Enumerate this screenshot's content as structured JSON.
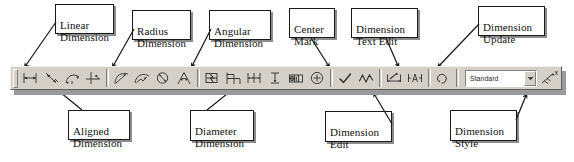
{
  "toolbar": {
    "grip_name": "toolbar-drag-grip",
    "style_combo": {
      "value": "Standard",
      "placeholder": "Standard",
      "arrow": "chevron-down-icon"
    },
    "close_label": "x",
    "buttons": [
      {
        "name": "linear-dimension",
        "label": "Linear Dimension",
        "icon": "linear-dimension-icon"
      },
      {
        "name": "aligned-dimension",
        "label": "Aligned Dimension",
        "icon": "aligned-dimension-icon"
      },
      {
        "name": "arc-length-dimension",
        "label": "Arc Length Dimension",
        "icon": "arc-length-dimension-icon"
      },
      {
        "name": "ordinate-dimension",
        "label": "Ordinate Dimension",
        "icon": "ordinate-dimension-icon"
      },
      {
        "name": "radius-dimension",
        "label": "Radius Dimension",
        "icon": "radius-dimension-icon"
      },
      {
        "name": "jogged-dimension",
        "label": "Jogged Dimension",
        "icon": "jogged-dimension-icon"
      },
      {
        "name": "diameter-dimension",
        "label": "Diameter Dimension",
        "icon": "diameter-dimension-icon"
      },
      {
        "name": "angular-dimension",
        "label": "Angular Dimension",
        "icon": "angular-dimension-icon"
      },
      {
        "name": "quick-dimension",
        "label": "Quick Dimension",
        "icon": "quick-dimension-icon"
      },
      {
        "name": "baseline-dimension",
        "label": "Baseline Dimension",
        "icon": "baseline-dimension-icon"
      },
      {
        "name": "continue-dimension",
        "label": "Continue Dimension",
        "icon": "continue-dimension-icon"
      },
      {
        "name": "quick-leader",
        "label": "Quick Leader",
        "icon": "quick-leader-icon"
      },
      {
        "name": "tolerance",
        "label": "Tolerance",
        "icon": "tolerance-icon"
      },
      {
        "name": "center-mark",
        "label": "Center Mark",
        "icon": "center-mark-icon"
      },
      {
        "name": "dimension-edit",
        "label": "Dimension Edit",
        "icon": "dimension-edit-icon"
      },
      {
        "name": "dimension-text-edit",
        "label": "Dimension Text Edit",
        "icon": "dimension-text-edit-icon"
      },
      {
        "name": "dimension-update",
        "label": "Dimension Update",
        "icon": "dimension-update-icon"
      },
      {
        "name": "dimension-style",
        "label": "Dimension Style",
        "icon": "dimension-style-icon"
      }
    ]
  },
  "callouts": {
    "linear_dimension": "Linear\nDimension",
    "radius_dimension": "Radius\nDimension",
    "angular_dimension": "Angular\nDimension",
    "center_mark": "Center\nMark",
    "dimension_text_edit": "Dimension\nText Edit",
    "dimension_update": "Dimension\nUpdate",
    "aligned_dimension": "Aligned\nDimension",
    "diameter_dimension": "Diameter\nDimension",
    "dimension_edit": "Dimension\nEdit",
    "dimension_style": "Dimension\nStyle"
  }
}
